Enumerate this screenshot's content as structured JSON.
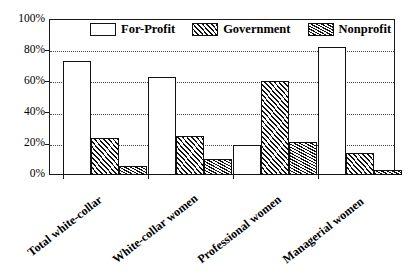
{
  "chart_data": {
    "type": "bar",
    "title": "",
    "subtitle": "",
    "xlabel": "",
    "ylabel": "",
    "ylim": [
      0,
      100
    ],
    "ytick_labels": [
      "0%",
      "20%",
      "40%",
      "60%",
      "80%",
      "100%"
    ],
    "ytick_values": [
      0,
      20,
      40,
      60,
      80,
      100
    ],
    "grid": true,
    "legend_position": "top-inside",
    "categories": [
      "Total white-collar",
      "White-collar women",
      "Professional women",
      "Managerial women"
    ],
    "series": [
      {
        "name": "For-Profit",
        "pattern": "empty",
        "values": [
          73,
          63,
          19,
          82
        ]
      },
      {
        "name": "Government",
        "pattern": "diagonal-hatch",
        "values": [
          24,
          25,
          60,
          14
        ]
      },
      {
        "name": "Nonprofit",
        "pattern": "zigzag-hatch",
        "values": [
          6,
          10,
          21,
          3
        ]
      }
    ],
    "colors": {
      "axis": "#1a1a1a",
      "grid": "#4a4a4a",
      "bar_outline": "#111111",
      "background": "#ffffff"
    }
  }
}
